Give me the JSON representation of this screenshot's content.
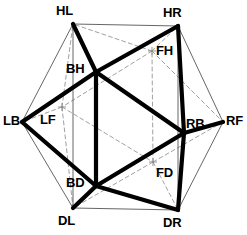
{
  "figure": {
    "kind": "polyhedron-wireframe-projection",
    "width": 247,
    "height": 235,
    "background": "#ffffff",
    "stroke_colors": {
      "bold_edge": "#000000",
      "thin_edge": "#555555",
      "hidden_edge": "#888888",
      "label_text": "#000000"
    },
    "stroke_widths": {
      "bold_edge": 4.2,
      "thin_edge": 0.9,
      "hidden_edge": 0.8,
      "marker": 0.9
    },
    "dash_pattern": "4,3"
  },
  "vertices": [
    {
      "id": "HL",
      "label": "HL",
      "x": 73,
      "y": 24,
      "kind": "outer",
      "label_x": 56,
      "label_y": 4
    },
    {
      "id": "HR",
      "label": "HR",
      "x": 178,
      "y": 26,
      "kind": "outer",
      "label_x": 163,
      "label_y": 6
    },
    {
      "id": "RF",
      "label": "RF",
      "x": 223,
      "y": 122,
      "kind": "outer",
      "label_x": 226,
      "label_y": 114
    },
    {
      "id": "DR",
      "label": "DR",
      "x": 178,
      "y": 210,
      "kind": "outer",
      "label_x": 163,
      "label_y": 216
    },
    {
      "id": "DL",
      "label": "DL",
      "x": 73,
      "y": 208,
      "kind": "outer",
      "label_x": 58,
      "label_y": 214
    },
    {
      "id": "LB",
      "label": "LB",
      "x": 22,
      "y": 122,
      "kind": "outer",
      "label_x": 3,
      "label_y": 114
    },
    {
      "id": "BH",
      "label": "BH",
      "x": 96,
      "y": 72,
      "kind": "front",
      "label_x": 66,
      "label_y": 62
    },
    {
      "id": "RB",
      "label": "RB",
      "x": 184,
      "y": 133,
      "kind": "front",
      "label_x": 186,
      "label_y": 117
    },
    {
      "id": "BD",
      "label": "BD",
      "x": 96,
      "y": 186,
      "kind": "front",
      "label_x": 66,
      "label_y": 176
    },
    {
      "id": "FH",
      "label": "FH",
      "x": 152,
      "y": 51,
      "kind": "hidden",
      "label_x": 156,
      "label_y": 44
    },
    {
      "id": "LF",
      "label": "LF",
      "x": 62,
      "y": 107,
      "kind": "hidden",
      "label_x": 40,
      "label_y": 113
    },
    {
      "id": "FD",
      "label": "FD",
      "x": 153,
      "y": 162,
      "kind": "hidden",
      "label_x": 156,
      "label_y": 166
    }
  ],
  "edges": {
    "bold": [
      [
        "BH",
        "RB"
      ],
      [
        "RB",
        "BD"
      ],
      [
        "BD",
        "BH"
      ],
      [
        "BH",
        "HL"
      ],
      [
        "BH",
        "HR"
      ],
      [
        "BH",
        "LB"
      ],
      [
        "RB",
        "HR"
      ],
      [
        "RB",
        "RF"
      ],
      [
        "RB",
        "DR"
      ],
      [
        "BD",
        "DL"
      ],
      [
        "BD",
        "DR"
      ],
      [
        "BD",
        "LB"
      ]
    ],
    "thin": [
      [
        "HL",
        "HR"
      ],
      [
        "HR",
        "RF"
      ],
      [
        "RF",
        "DR"
      ],
      [
        "DR",
        "DL"
      ],
      [
        "DL",
        "LB"
      ],
      [
        "LB",
        "HL"
      ],
      [
        "HR",
        "DR"
      ],
      [
        "HL",
        "DL"
      ]
    ],
    "hidden": [
      [
        "FH",
        "LF"
      ],
      [
        "LF",
        "FD"
      ],
      [
        "FD",
        "FH"
      ],
      [
        "FH",
        "HL"
      ],
      [
        "FH",
        "HR"
      ],
      [
        "FH",
        "RF"
      ],
      [
        "LF",
        "HL"
      ],
      [
        "LF",
        "LB"
      ],
      [
        "LF",
        "DL"
      ],
      [
        "FD",
        "RF"
      ],
      [
        "FD",
        "DR"
      ],
      [
        "FD",
        "DL"
      ]
    ]
  },
  "markers": {
    "hidden_vertex_cross_size": 4
  }
}
